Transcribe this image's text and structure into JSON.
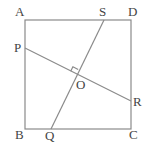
{
  "diagram": {
    "type": "geometry",
    "colors": {
      "line": "#8a8a8a",
      "label": "#444444",
      "background": "#ffffff"
    },
    "points": {
      "A": {
        "label": "A",
        "x": 25,
        "y": 20
      },
      "B": {
        "label": "B",
        "x": 25,
        "y": 129
      },
      "C": {
        "label": "C",
        "x": 131,
        "y": 129
      },
      "D": {
        "label": "D",
        "x": 131,
        "y": 20
      },
      "P": {
        "label": "P",
        "x": 25,
        "y": 48
      },
      "Q": {
        "label": "Q",
        "x": 51,
        "y": 129
      },
      "R": {
        "label": "R",
        "x": 131,
        "y": 101
      },
      "S": {
        "label": "S",
        "x": 104,
        "y": 20
      },
      "O": {
        "label": "O",
        "x": 76,
        "y": 74
      }
    },
    "segments": [
      [
        "A",
        "D"
      ],
      [
        "D",
        "C"
      ],
      [
        "C",
        "B"
      ],
      [
        "B",
        "A"
      ],
      [
        "P",
        "R"
      ],
      [
        "S",
        "Q"
      ]
    ],
    "annotations": [
      {
        "type": "right-angle",
        "at": "O",
        "between": [
          "PR",
          "SQ"
        ]
      }
    ]
  }
}
